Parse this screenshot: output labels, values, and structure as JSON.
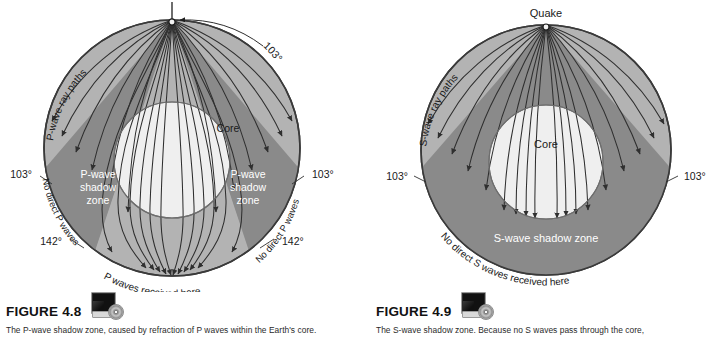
{
  "figures": [
    {
      "id": "p-wave",
      "number": "FIGURE 4.8",
      "caption": "The P-wave shadow zone, caused by refraction of P waves within the Earth's core.",
      "icon": "cd-rom-icon",
      "diagram": {
        "type": "earth-cross-section",
        "quake_label": "",
        "core_label": "Core",
        "ray_label": "P-wave ray paths",
        "shadow_label_left": "P-wave shadow zone",
        "shadow_label_right": "P-wave shadow zone",
        "arc_label_outer_top": "103°",
        "angle_left_103": "103°",
        "angle_right_103": "103°",
        "angle_left_142": "142°",
        "angle_right_142": "142°",
        "no_direct_left": "No direct P waves",
        "no_direct_right": "No direct P waves",
        "received_label": "P waves received here",
        "colors": {
          "mantle": "#b3b3b3",
          "shadow": "#8a8a8a",
          "core": "#efefef",
          "outline": "#3a3a3a",
          "ray": "#2f2f2f",
          "label_light": "#ffffff",
          "label_dark": "#1a1a1a"
        }
      }
    },
    {
      "id": "s-wave",
      "number": "FIGURE 4.9",
      "caption": "The S-wave shadow zone. Because no S waves pass through the core,",
      "icon": "cd-rom-icon",
      "diagram": {
        "type": "earth-cross-section",
        "quake_label": "Quake",
        "core_label": "Core",
        "ray_label": "S-wave ray paths",
        "shadow_label_bottom": "S-wave shadow zone",
        "angle_left_103": "103°",
        "angle_right_103": "103°",
        "received_label": "No direct S waves received here",
        "colors": {
          "mantle": "#b3b3b3",
          "shadow": "#8a8a8a",
          "core": "#efefef",
          "outline": "#3a3a3a",
          "ray": "#2f2f2f",
          "label_light": "#ffffff",
          "label_dark": "#1a1a1a"
        }
      }
    }
  ]
}
